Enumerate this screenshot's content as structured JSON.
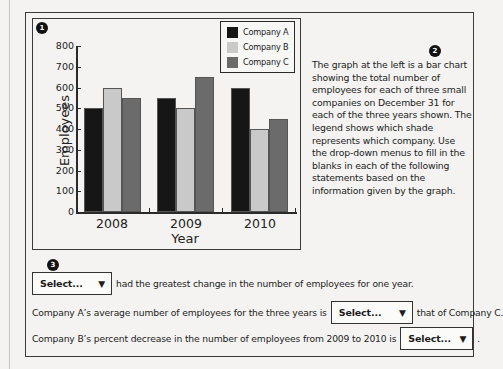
{
  "badges": {
    "chart": "1",
    "description": "2",
    "questions": "3"
  },
  "description": "The graph at the left is a bar chart showing the total number of employees for each of three small companies on December 31 for each of the three years shown. The legend shows which shade represents which company. Use the drop-down menus to fill in the blanks in each of the following statements based on the information given by the graph.",
  "questions": [
    {
      "before": "",
      "select": "Select...",
      "after": "had the greatest change in the number of employees for one year."
    },
    {
      "before": "Company A’s average number of employees for the three years is",
      "select": "Select...",
      "after": "that of Company C."
    },
    {
      "before": "Company B’s percent decrease in the number of employees from 2009 to 2010 is",
      "select": "Select...",
      "after": "."
    }
  ],
  "icons": {
    "dropdown": "▼"
  },
  "colors": {
    "company_a": "#161616",
    "company_b": "#c9c9c9",
    "company_c": "#6b6b6b"
  },
  "chart_data": {
    "type": "bar",
    "title": "",
    "xlabel": "Year",
    "ylabel": "Employees",
    "categories": [
      "2008",
      "2009",
      "2010"
    ],
    "series": [
      {
        "name": "Company A",
        "values": [
          500,
          550,
          600
        ]
      },
      {
        "name": "Company B",
        "values": [
          600,
          500,
          400
        ]
      },
      {
        "name": "Company C",
        "values": [
          550,
          650,
          450
        ]
      }
    ],
    "ylim": [
      0,
      800
    ],
    "yticks": [
      "0",
      "100",
      "200",
      "300",
      "400",
      "500",
      "600",
      "700",
      "800"
    ],
    "grid": false,
    "legend_position": "top-right"
  }
}
